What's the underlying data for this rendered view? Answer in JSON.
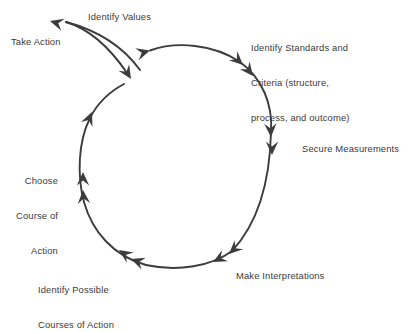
{
  "diagram": {
    "type": "cyclic-process",
    "stroke_color": "#3c3c3c",
    "text_color": "#3a3a3a",
    "background_color": "#ffffff",
    "direction": "clockwise",
    "nodes": [
      {
        "id": "identify-values",
        "label": "Identify Values",
        "lines": [
          "Identify Values"
        ],
        "angle_deg": 285
      },
      {
        "id": "identify-standards-criteria",
        "label": "Identify Standards and Criteria (structure, process, and outcome)",
        "lines": [
          "Identify Standards and",
          "Criteria (structure,",
          "process, and outcome)"
        ],
        "angle_deg": 330
      },
      {
        "id": "secure-measurements",
        "label": "Secure Measurements",
        "lines": [
          "Secure Measurements"
        ],
        "angle_deg": 0
      },
      {
        "id": "make-interpretations",
        "label": "Make Interpretations",
        "lines": [
          "Make Interpretations"
        ],
        "angle_deg": 55
      },
      {
        "id": "identify-possible-courses-of-action",
        "label": "Identify Possible Courses of Action",
        "lines": [
          "Identify Possible",
          "Courses of Action"
        ],
        "angle_deg": 125
      },
      {
        "id": "choose-course-of-action",
        "label": "Choose Course of Action",
        "lines": [
          "Choose",
          "Course of",
          "Action"
        ],
        "angle_deg": 180
      },
      {
        "id": "take-action",
        "label": "Take Action",
        "lines": [
          "Take Action"
        ],
        "angle_deg": 225
      }
    ],
    "arrowhead_count": 11
  }
}
